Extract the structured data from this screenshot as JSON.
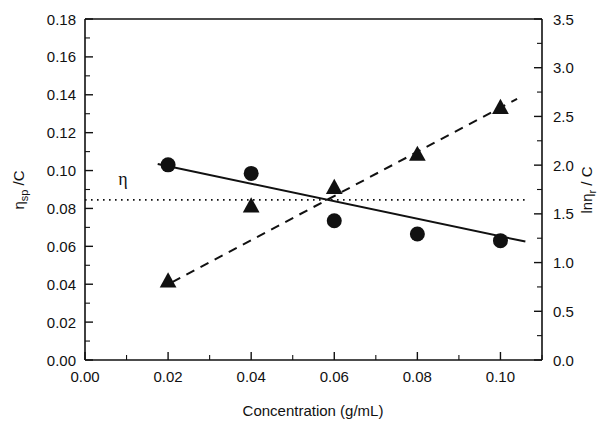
{
  "chart_data": {
    "type": "scatter",
    "title": "",
    "subtitle": "",
    "xlabel": "Concentration (g/mL)",
    "ylabel": "ηsp /C",
    "y2label": "lnηr / C",
    "xlim": [
      0.0,
      0.11
    ],
    "ylim": [
      0.0,
      0.18
    ],
    "y2lim": [
      0.0,
      3.5
    ],
    "grid": false,
    "legend": "none",
    "xticks": [
      "0.00",
      "0.02",
      "0.04",
      "0.06",
      "0.08",
      "0.10"
    ],
    "xtick_values": [
      0.0,
      0.02,
      0.04,
      0.06,
      0.08,
      0.1
    ],
    "yticks": [
      "0.00",
      "0.02",
      "0.04",
      "0.06",
      "0.08",
      "0.10",
      "0.12",
      "0.14",
      "0.16",
      "0.18"
    ],
    "ytick_values": [
      0.0,
      0.02,
      0.04,
      0.06,
      0.08,
      0.1,
      0.12,
      0.14,
      0.16,
      0.18
    ],
    "y2ticks": [
      "0.0",
      "0.5",
      "1.0",
      "1.5",
      "2.0",
      "2.5",
      "3.0",
      "3.5"
    ],
    "y2tick_values": [
      0.0,
      0.5,
      1.0,
      1.5,
      2.0,
      2.5,
      3.0,
      3.5
    ],
    "series": [
      {
        "name": "ηsp/C",
        "marker": "circle",
        "axis": "left",
        "line_style": "solid",
        "x": [
          0.02,
          0.04,
          0.06,
          0.08,
          0.1
        ],
        "values": [
          0.103,
          0.0985,
          0.0735,
          0.0665,
          0.063
        ],
        "fit_line": {
          "x": [
            0.0175,
            0.106
          ],
          "y": [
            0.1035,
            0.0625
          ]
        }
      },
      {
        "name": "lnηr/C",
        "marker": "triangle",
        "axis": "right",
        "line_style": "dashed",
        "x": [
          0.02,
          0.04,
          0.06,
          0.08,
          0.1
        ],
        "values": [
          0.81,
          1.58,
          1.77,
          2.11,
          2.59
        ],
        "fit_line": {
          "x": [
            0.021,
            0.104
          ],
          "y": [
            0.8,
            2.68
          ]
        }
      }
    ],
    "annotations": [
      {
        "text": "η",
        "x": 0.008,
        "y": 0.0925,
        "axis": "left"
      }
    ],
    "reference_lines": [
      {
        "style": "dotted",
        "axis": "left",
        "y": 0.0845,
        "x_start": 0.0,
        "x_end": 0.106
      }
    ]
  }
}
